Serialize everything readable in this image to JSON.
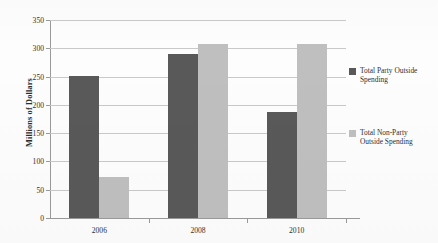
{
  "chart_data": {
    "type": "bar",
    "title": "",
    "subtitle": "",
    "xlabel": "",
    "ylabel": "Millions of Dollars",
    "categories": [
      "2006",
      "2008",
      "2010"
    ],
    "series": [
      {
        "name": "Total Party Outside Spending",
        "color": "#595959",
        "values": [
          251,
          290,
          188
        ]
      },
      {
        "name": "Total Non-Party Outside Spending",
        "color": "#bfbfbf",
        "values": [
          73,
          308,
          308
        ]
      }
    ],
    "ylim": [
      0,
      350
    ],
    "ytick_values": [
      0,
      50,
      100,
      150,
      200,
      250,
      300,
      350
    ],
    "ytick_labels": [
      "0",
      "50",
      "100",
      "150",
      "200",
      "250",
      "300",
      "350"
    ],
    "grid": true,
    "grid_axis": "y",
    "legend_position": "right",
    "legend": [
      "Total Party Outside Spending",
      "Total Non-Party Outside Spending"
    ]
  },
  "axes": {
    "y_title": "Millions of Dollars"
  }
}
